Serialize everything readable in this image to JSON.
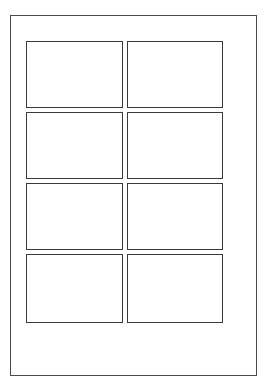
{
  "diagram": {
    "title": "",
    "page": {
      "left": 10,
      "top": 15,
      "width": 247,
      "height": 361
    },
    "grid": {
      "columns": 2,
      "rows": 4,
      "cells": [
        {
          "row": 1,
          "col": 1,
          "x": 26,
          "y": 41,
          "w": 97,
          "h": 67
        },
        {
          "row": 1,
          "col": 2,
          "x": 127,
          "y": 41,
          "w": 96,
          "h": 67
        },
        {
          "row": 2,
          "col": 1,
          "x": 26,
          "y": 112,
          "w": 97,
          "h": 67
        },
        {
          "row": 2,
          "col": 2,
          "x": 127,
          "y": 112,
          "w": 96,
          "h": 67
        },
        {
          "row": 3,
          "col": 1,
          "x": 26,
          "y": 183,
          "w": 97,
          "h": 67
        },
        {
          "row": 3,
          "col": 2,
          "x": 127,
          "y": 183,
          "w": 96,
          "h": 67
        },
        {
          "row": 4,
          "col": 1,
          "x": 26,
          "y": 254,
          "w": 97,
          "h": 69
        },
        {
          "row": 4,
          "col": 2,
          "x": 127,
          "y": 254,
          "w": 96,
          "h": 69
        }
      ]
    },
    "colors": {
      "border": "#3a3a3a",
      "background": "#ffffff"
    }
  }
}
